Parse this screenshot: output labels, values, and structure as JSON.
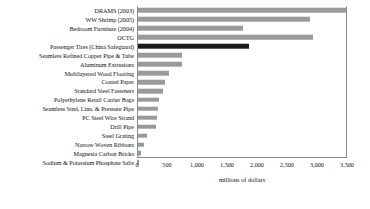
{
  "chart_data": {
    "type": "bar",
    "orientation": "horizontal",
    "title": "",
    "xlabel": "millions of dollars",
    "ylabel": "",
    "xlim": [
      0,
      3500
    ],
    "xticks": [
      0,
      500,
      1000,
      1500,
      2000,
      2500,
      3000,
      3500
    ],
    "xticklabels": [
      "0",
      "500",
      "1,000",
      "1,500",
      "2,000",
      "2,500",
      "3,000",
      "3,500"
    ],
    "grid": false,
    "legend": "none",
    "bar_color": "#9a9a9a",
    "highlight_color": "#1c1c1c",
    "categories": [
      "DRAMS (2003)",
      "WW Shrimp (2005)",
      "Bedroom Furniture (2004)",
      "OCTG",
      "Passenger Tires (China Safeguard)",
      "Seamless Refined Copper Pipe & Tube",
      "Aluminum Extrusions",
      "Multilayered Wood Flooring",
      "Coated Paper",
      "Standard Steel Fasteners",
      "Polyethylene Retail Carrier Bags",
      "Seamless Stnd, Line, & Pressure Pipe",
      "PC Steel Wire Strand",
      "Drill Pipe",
      "Steel Grating",
      "Narrow Woven Ribbons",
      "Magnesia Carbon Bricks",
      "Sodium & Potassium Phosphate Salts"
    ],
    "values": [
      3500,
      2880,
      1770,
      2930,
      1860,
      750,
      750,
      530,
      460,
      440,
      370,
      350,
      330,
      320,
      160,
      110,
      60,
      35
    ],
    "highlighted": [
      "Passenger Tires (China Safeguard)"
    ]
  }
}
